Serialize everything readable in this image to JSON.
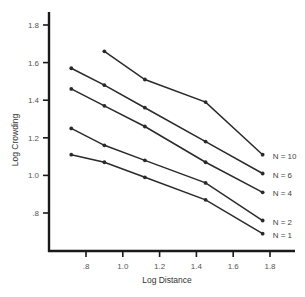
{
  "chart_data": {
    "type": "line",
    "title": "",
    "xlabel": "Log Distance",
    "ylabel": "Log Crowding",
    "xlim": [
      0.6,
      1.88
    ],
    "ylim": [
      0.6,
      1.86
    ],
    "xticks": [
      0.8,
      1.0,
      1.2,
      1.4,
      1.6,
      1.8
    ],
    "xtick_labels": [
      ".8",
      "1.0",
      "1.2",
      "1.4",
      "1.6",
      "1.8"
    ],
    "yticks": [
      0.8,
      1.0,
      1.2,
      1.4,
      1.6,
      1.8
    ],
    "ytick_labels": [
      ".8",
      "1.0",
      "1.2",
      "1.4",
      "1.6",
      "1.8"
    ],
    "grid": false,
    "legend": "inline-right",
    "line_color": "#2a2a2a",
    "series": [
      {
        "name": "N = 10",
        "x": [
          0.9,
          1.12,
          1.45,
          1.76
        ],
        "y": [
          1.66,
          1.51,
          1.39,
          1.11
        ]
      },
      {
        "name": "N = 6",
        "x": [
          0.72,
          0.9,
          1.12,
          1.45,
          1.76
        ],
        "y": [
          1.57,
          1.48,
          1.36,
          1.18,
          1.01
        ]
      },
      {
        "name": "N = 4",
        "x": [
          0.72,
          0.9,
          1.12,
          1.45,
          1.76
        ],
        "y": [
          1.46,
          1.37,
          1.26,
          1.07,
          0.91
        ]
      },
      {
        "name": "N = 2",
        "x": [
          0.72,
          0.9,
          1.12,
          1.45,
          1.76
        ],
        "y": [
          1.25,
          1.16,
          1.08,
          0.96,
          0.76
        ]
      },
      {
        "name": "N = 1",
        "x": [
          0.72,
          0.9,
          1.12,
          1.45,
          1.76
        ],
        "y": [
          1.11,
          1.07,
          0.99,
          0.87,
          0.69
        ]
      }
    ]
  }
}
